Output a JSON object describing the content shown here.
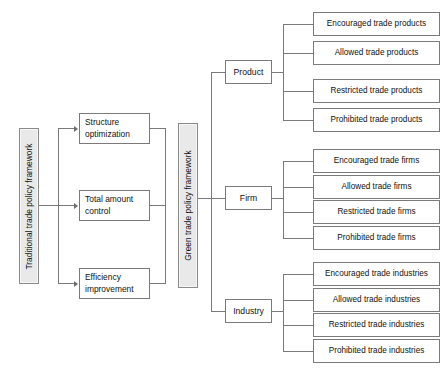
{
  "diagram": {
    "frameworks": {
      "traditional": "Traditional trade policy framework",
      "green": "Green trade policy framework"
    },
    "stages": [
      {
        "line1": "Structure",
        "line2": "optimization",
        "full": "Structure optimization"
      },
      {
        "line1": "Total  amount",
        "line2": "control",
        "full": "Total amount control"
      },
      {
        "line1": "Efficiency",
        "line2": "improvement",
        "full": "Efficiency improvement"
      }
    ],
    "categories": [
      {
        "label": "Product"
      },
      {
        "label": "Firm"
      },
      {
        "label": "Industry"
      }
    ],
    "leaves": {
      "product": [
        "Encouraged trade products",
        "Allowed trade products",
        "Restricted trade products",
        "Prohibited trade products"
      ],
      "firm": [
        "Encouraged trade firms",
        "Allowed trade firms",
        "Restricted trade firms",
        "Prohibited trade firms"
      ],
      "industry": [
        "Encouraged trade industries",
        "Allowed trade industries",
        "Restricted trade industries",
        "Prohibited trade industries"
      ]
    },
    "colors": {
      "line": "#7a7a7a",
      "box_border": "#7a7a7a",
      "pillar_fill": "#e9e9e9",
      "pillar_border": "#8a8a8a",
      "text": "#111111",
      "background": "#ffffff"
    }
  }
}
